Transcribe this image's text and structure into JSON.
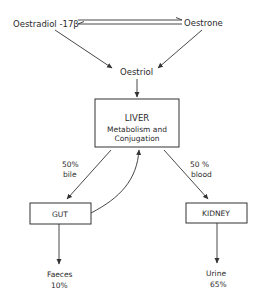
{
  "diagram": {
    "nodes": {
      "oestradiol": "Oestradiol -17β",
      "oestrone": "Oestrone",
      "oestriol": "Oestriol",
      "liver": {
        "title": "LIVER",
        "line1": "Metabolism and",
        "line2": "Conjugation"
      },
      "gut": "GUT",
      "kidney": "KIDNEY",
      "faeces": {
        "label": "Faeces",
        "percent": "10%"
      },
      "urine": {
        "label": "Urine",
        "percent": "65%"
      }
    },
    "edges": {
      "bile": {
        "percent": "50%",
        "route": "bile"
      },
      "blood": {
        "percent": "50 %",
        "route": "blood"
      }
    },
    "colors": {
      "line": "#333333",
      "text": "#2a2a2a",
      "background": "#ffffff"
    }
  }
}
